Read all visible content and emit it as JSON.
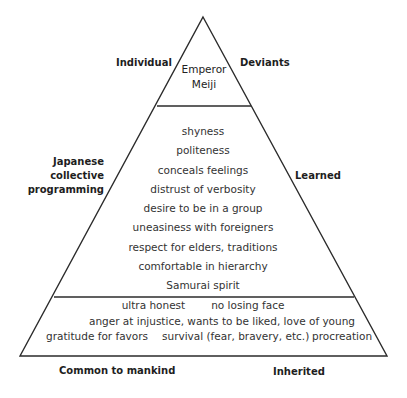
{
  "diagram": {
    "type": "pyramid",
    "levels": [
      {
        "name": "Individual",
        "content": [
          "Emperor",
          "Meiji"
        ]
      },
      {
        "name": "Japanese collective programming",
        "content": [
          "shyness",
          "politeness",
          "conceals feelings",
          "distrust of verbosity",
          "desire to be in a group",
          "uneasiness with foreigners",
          "respect for elders, traditions",
          "comfortable in hierarchy",
          "Samurai spirit"
        ],
        "last_row": [
          "ultra honest",
          "no losing face"
        ]
      },
      {
        "name": "Common to mankind",
        "row1": "anger at injustice, wants to be liked, love of young",
        "row2": [
          "gratitude for favors",
          "survival (fear, bravery, etc.)",
          "procreation"
        ]
      }
    ]
  },
  "labels": {
    "left_top": "Individual",
    "left_mid": [
      "Japanese",
      "collective",
      "programming"
    ],
    "left_bottom": "Common to mankind",
    "right_top": "Deviants",
    "right_mid": "Learned",
    "right_bottom": "Inherited"
  },
  "colors": {
    "line": "#2b2b2b",
    "text": "#2a2a2a"
  }
}
